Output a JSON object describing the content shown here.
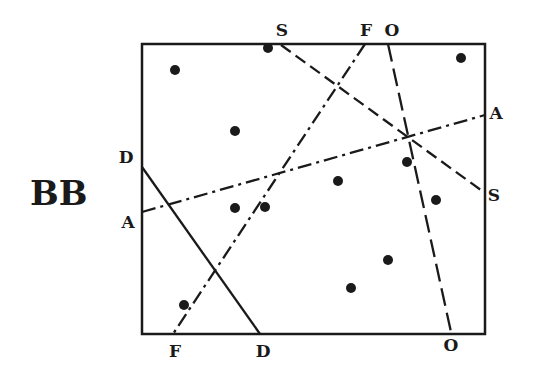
{
  "title": "BB",
  "frame": {
    "x1": 142,
    "y1": 44,
    "x2": 485,
    "y2": 334,
    "color": "#1a1a1a"
  },
  "lines": [
    {
      "name": "S",
      "style": "dashed",
      "x1": 281,
      "y1": 45,
      "x2": 485,
      "y2": 193,
      "labels": [
        {
          "text": "S",
          "x": 282,
          "y": 36
        },
        {
          "text": "S",
          "x": 494,
          "y": 201
        }
      ]
    },
    {
      "name": "F",
      "style": "dashdot",
      "x1": 365,
      "y1": 44,
      "x2": 173,
      "y2": 334,
      "labels": [
        {
          "text": "F",
          "x": 366,
          "y": 36
        },
        {
          "text": "F",
          "x": 175,
          "y": 357
        }
      ]
    },
    {
      "name": "O",
      "style": "longdash",
      "x1": 388,
      "y1": 44,
      "x2": 451,
      "y2": 332,
      "labels": [
        {
          "text": "O",
          "x": 392,
          "y": 36
        },
        {
          "text": "O",
          "x": 451,
          "y": 351
        }
      ]
    },
    {
      "name": "A",
      "style": "dashdot",
      "x1": 142,
      "y1": 212,
      "x2": 485,
      "y2": 115,
      "labels": [
        {
          "text": "A",
          "x": 128,
          "y": 228
        },
        {
          "text": "A",
          "x": 496,
          "y": 119
        }
      ]
    },
    {
      "name": "D",
      "style": "solid",
      "x1": 142,
      "y1": 167,
      "x2": 260,
      "y2": 334,
      "labels": [
        {
          "text": "D",
          "x": 126,
          "y": 163
        },
        {
          "text": "D",
          "x": 263,
          "y": 357
        }
      ]
    }
  ],
  "points": [
    {
      "x": 175,
      "y": 70
    },
    {
      "x": 268,
      "y": 48
    },
    {
      "x": 461,
      "y": 58
    },
    {
      "x": 235,
      "y": 131
    },
    {
      "x": 407,
      "y": 162
    },
    {
      "x": 338,
      "y": 181
    },
    {
      "x": 436,
      "y": 200
    },
    {
      "x": 235,
      "y": 208
    },
    {
      "x": 265,
      "y": 207
    },
    {
      "x": 388,
      "y": 260
    },
    {
      "x": 351,
      "y": 288
    },
    {
      "x": 184,
      "y": 305
    }
  ]
}
